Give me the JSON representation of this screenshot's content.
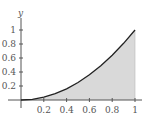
{
  "chart_data": {
    "type": "area",
    "title": "",
    "xlabel": "",
    "ylabel": "y",
    "function": "y = x^2",
    "x": [
      0,
      0.1,
      0.2,
      0.3,
      0.4,
      0.5,
      0.6,
      0.7,
      0.8,
      0.9,
      1.0
    ],
    "series": [
      {
        "name": "y = x^2",
        "values": [
          0,
          0.01,
          0.04,
          0.09,
          0.16,
          0.25,
          0.36,
          0.49,
          0.64,
          0.81,
          1.0
        ]
      }
    ],
    "shaded_region": {
      "from_x": 0,
      "to_x": 1,
      "under": "curve",
      "color": "#d9d9d9"
    },
    "xlim": [
      0,
      1
    ],
    "ylim": [
      0,
      1
    ],
    "x_ticks": [
      "0.2",
      "0.4",
      "0.6",
      "0.8",
      "1"
    ],
    "y_ticks": [
      "0.2",
      "0.4",
      "0.6",
      "0.8",
      "1"
    ],
    "grid": false,
    "legend": null,
    "colors": {
      "curve": "#222222",
      "fill": "#d9d9d9",
      "axes": "#555555"
    }
  }
}
